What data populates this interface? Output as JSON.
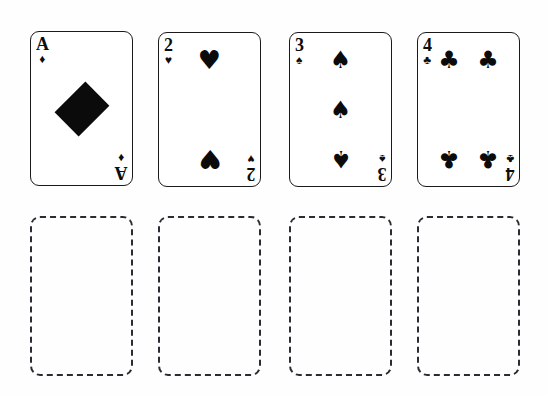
{
  "scene": {
    "title": "Playing cards row with empty drop slots",
    "background_color": "#fefefe",
    "ink_color": "#0b0b0b",
    "slot_border_color": "#2b2b33"
  },
  "cards": [
    {
      "id": "card-ace-diamonds",
      "rank": "A",
      "suit": "diamonds",
      "suit_symbol": "♦",
      "suit_name": "diamond-pip",
      "label": "Ace of Diamonds",
      "pip_count": 1,
      "x": 30,
      "y": 31,
      "w": 103,
      "h": 155
    },
    {
      "id": "card-2-hearts",
      "rank": "2",
      "suit": "hearts",
      "suit_symbol": "♥",
      "suit_name": "heart-pip",
      "label": "Two of Hearts",
      "pip_count": 2,
      "x": 158,
      "y": 32,
      "w": 103,
      "h": 155
    },
    {
      "id": "card-3-spades",
      "rank": "3",
      "suit": "spades",
      "suit_symbol": "♠",
      "suit_name": "spade-pip",
      "label": "Three of Spades",
      "pip_count": 3,
      "x": 289,
      "y": 32,
      "w": 103,
      "h": 155
    },
    {
      "id": "card-4-clubs",
      "rank": "4",
      "suit": "clubs",
      "suit_symbol": "♣",
      "suit_name": "club-pip",
      "label": "Four of Clubs",
      "pip_count": 4,
      "x": 417,
      "y": 32,
      "w": 103,
      "h": 155
    }
  ],
  "slots": [
    {
      "id": "slot-1",
      "label": "Empty card slot 1",
      "x": 30,
      "y": 216,
      "w": 103,
      "h": 160
    },
    {
      "id": "slot-2",
      "label": "Empty card slot 2",
      "x": 158,
      "y": 216,
      "w": 103,
      "h": 160
    },
    {
      "id": "slot-3",
      "label": "Empty card slot 3",
      "x": 289,
      "y": 216,
      "w": 103,
      "h": 160
    },
    {
      "id": "slot-4",
      "label": "Empty card slot 4",
      "x": 417,
      "y": 216,
      "w": 103,
      "h": 160
    }
  ]
}
